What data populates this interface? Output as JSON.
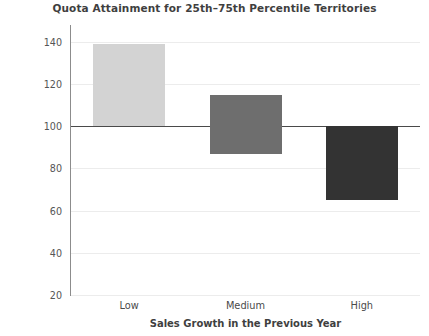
{
  "chart_data": {
    "type": "bar",
    "title": "Quota Attainment for 25th–75th Percentile Territories",
    "xlabel": "Sales Growth in the Previous Year",
    "ylabel": "Percentage of Quota Attainment\nin the Current Year",
    "categories": [
      "Low",
      "Medium",
      "High"
    ],
    "baseline": 100,
    "bars": [
      {
        "category": "Low",
        "low": 100,
        "high": 139,
        "color": "#d3d3d3"
      },
      {
        "category": "Medium",
        "low": 87,
        "high": 115,
        "color": "#6e6e6e"
      },
      {
        "category": "High",
        "low": 65,
        "high": 100,
        "color": "#333333"
      }
    ],
    "values": [
      139,
      115,
      65
    ],
    "ylim": [
      20,
      148
    ],
    "yticks": [
      20,
      40,
      60,
      80,
      100,
      120,
      140
    ],
    "ytick_labels": [
      "20",
      "40",
      "60",
      "80",
      "100",
      "120",
      "140"
    ],
    "grid": true,
    "legend": "none"
  }
}
